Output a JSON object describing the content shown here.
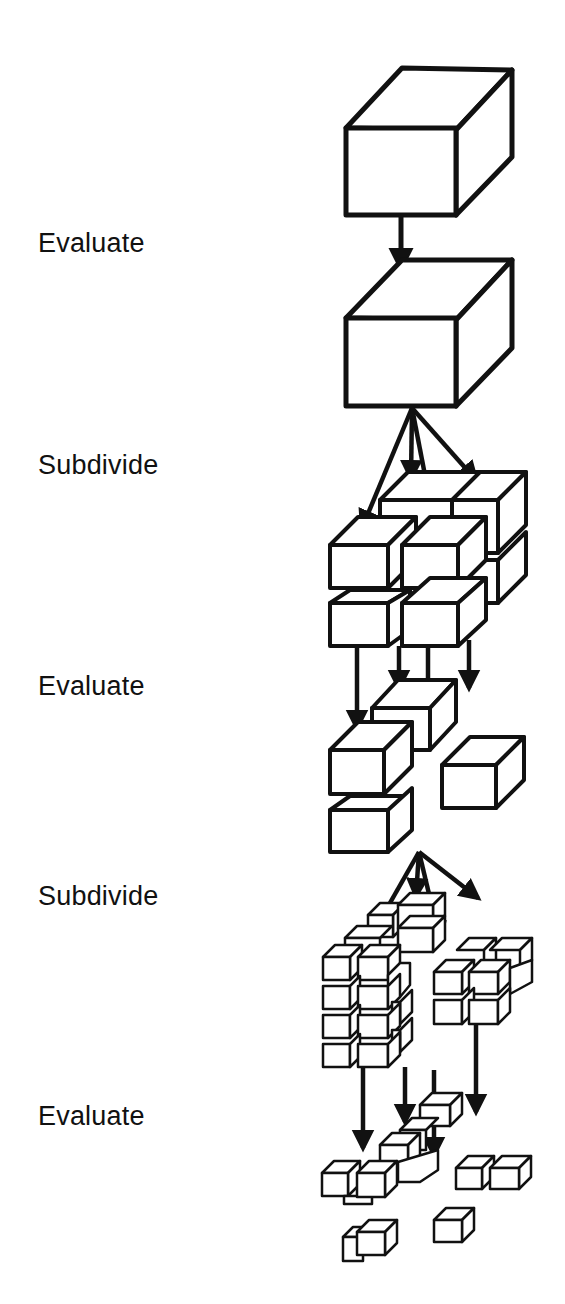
{
  "diagram": {
    "type": "octree-subdivision-flow",
    "stroke_color": "#111111",
    "fill_color": "#ffffff",
    "stages": [
      {
        "label": "Evaluate",
        "y": 245
      },
      {
        "label": "Subdivide",
        "y": 467
      },
      {
        "label": "Evaluate",
        "y": 688
      },
      {
        "label": "Subdivide",
        "y": 898
      },
      {
        "label": "Evaluate",
        "y": 1118
      }
    ]
  }
}
